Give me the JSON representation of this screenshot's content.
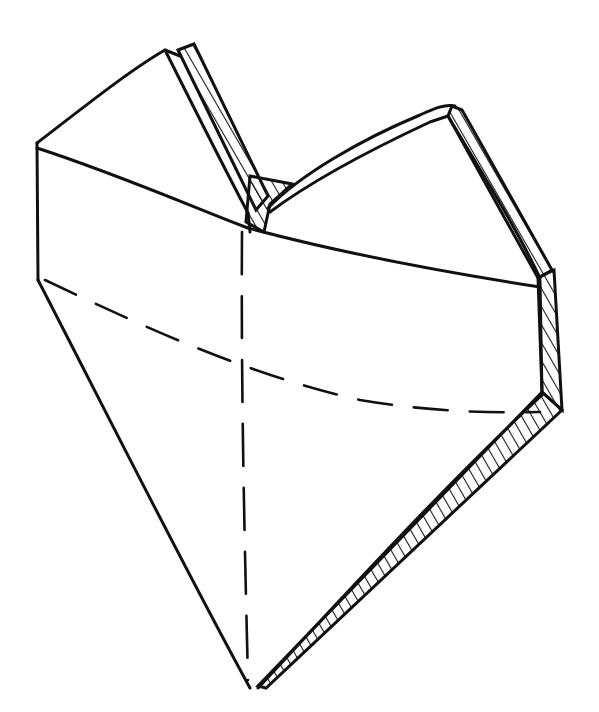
{
  "image": {
    "description": "Hand-drawn pen sketch of a three-dimensional faceted heart shape with hatched side edges",
    "width": 599,
    "height": 712,
    "colors": {
      "background": "#ffffff",
      "ink": "#111111"
    }
  },
  "outline": [
    "M37,143 L165,50 L180,60 L248,213 L258,200 L268,210 L270,205 L360,150 L450,108 L462,112 L545,272 L540,395 L530,418 L262,688 L248,690 L42,280 L37,143 Z"
  ],
  "inner_lines": [
    "M37,148 C120,175 200,210 248,228 C330,250 430,270 540,287",
    "M248,228 L250,240",
    "M462,112 L548,270",
    "M548,270 L555,276 L562,410 L545,395",
    "M562,410 L268,688",
    "M37,143 L37,280"
  ],
  "dashed_lines": [
    "M45,280 C150,330 250,375 360,400 C430,412 490,413 540,412",
    "M240,228 C240,380 244,520 248,688"
  ],
  "hatched_bands": [
    {
      "name": "left-lobe-edge",
      "points": "180,48 195,45 262,210 248,213"
    },
    {
      "name": "notch",
      "points": "248,175 290,183 270,205 258,232 250,228"
    },
    {
      "name": "right-lobe-edge",
      "points": "455,105 462,112 550,270 540,275 448,115"
    },
    {
      "name": "right-side",
      "points": "540,275 555,272 562,410 545,395"
    },
    {
      "name": "bottom-right-edge",
      "points": "545,395 562,410 268,688 262,686"
    }
  ]
}
